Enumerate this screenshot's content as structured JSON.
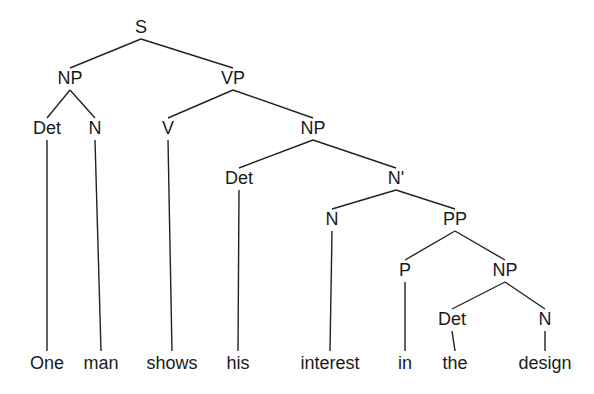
{
  "figure": {
    "kind": "syntax-tree",
    "sentence": "One man shows his interest in the design",
    "background_color": "#ffffff",
    "line_color": "#222222",
    "text_color": "#1a1a1a"
  },
  "nodes": [
    {
      "id": "s",
      "label": "S",
      "x": 141,
      "y": 33,
      "level": 0
    },
    {
      "id": "np1",
      "label": "NP",
      "x": 70,
      "y": 84,
      "level": 1
    },
    {
      "id": "vp",
      "label": "VP",
      "x": 233,
      "y": 84,
      "level": 1
    },
    {
      "id": "det1",
      "label": "Det",
      "x": 47,
      "y": 134,
      "level": 2
    },
    {
      "id": "n1",
      "label": "N",
      "x": 95,
      "y": 134,
      "level": 2
    },
    {
      "id": "v",
      "label": "V",
      "x": 168,
      "y": 134,
      "level": 2
    },
    {
      "id": "np2",
      "label": "NP",
      "x": 313,
      "y": 134,
      "level": 2
    },
    {
      "id": "det2",
      "label": "Det",
      "x": 239,
      "y": 184,
      "level": 3
    },
    {
      "id": "nbar",
      "label": "N'",
      "x": 396,
      "y": 184,
      "level": 3
    },
    {
      "id": "n2",
      "label": "N",
      "x": 332,
      "y": 225,
      "level": 4
    },
    {
      "id": "pp",
      "label": "PP",
      "x": 455,
      "y": 225,
      "level": 4
    },
    {
      "id": "p",
      "label": "P",
      "x": 405,
      "y": 276,
      "level": 5
    },
    {
      "id": "np3",
      "label": "NP",
      "x": 505,
      "y": 276,
      "level": 5
    },
    {
      "id": "det3",
      "label": "Det",
      "x": 452,
      "y": 325,
      "level": 6
    },
    {
      "id": "n3",
      "label": "N",
      "x": 545,
      "y": 325,
      "level": 6
    }
  ],
  "edges": [
    {
      "from": "s",
      "to": "np1"
    },
    {
      "from": "s",
      "to": "vp"
    },
    {
      "from": "np1",
      "to": "det1"
    },
    {
      "from": "np1",
      "to": "n1"
    },
    {
      "from": "vp",
      "to": "v"
    },
    {
      "from": "vp",
      "to": "np2"
    },
    {
      "from": "np2",
      "to": "det2"
    },
    {
      "from": "np2",
      "to": "nbar"
    },
    {
      "from": "nbar",
      "to": "n2"
    },
    {
      "from": "nbar",
      "to": "pp"
    },
    {
      "from": "pp",
      "to": "p"
    },
    {
      "from": "pp",
      "to": "np3"
    },
    {
      "from": "np3",
      "to": "det3"
    },
    {
      "from": "np3",
      "to": "n3"
    }
  ],
  "leaves": [
    {
      "id": "w-one",
      "label": "One",
      "parent": "det1",
      "x": 47,
      "y": 369,
      "stem_top": 140,
      "stem_bottom": 351
    },
    {
      "id": "w-man",
      "label": "man",
      "parent": "n1",
      "x": 101,
      "y": 369,
      "stem_top": 140,
      "stem_bottom": 351
    },
    {
      "id": "w-shows",
      "label": "shows",
      "parent": "v",
      "x": 172,
      "y": 369,
      "stem_top": 140,
      "stem_bottom": 351
    },
    {
      "id": "w-his",
      "label": "his",
      "parent": "det2",
      "x": 238,
      "y": 369,
      "stem_top": 190,
      "stem_bottom": 351
    },
    {
      "id": "w-interest",
      "label": "interest",
      "parent": "n2",
      "x": 330,
      "y": 369,
      "stem_top": 231,
      "stem_bottom": 351
    },
    {
      "id": "w-in",
      "label": "in",
      "parent": "p",
      "x": 405,
      "y": 369,
      "stem_top": 282,
      "stem_bottom": 351
    },
    {
      "id": "w-the",
      "label": "the",
      "parent": "det3",
      "x": 455,
      "y": 369,
      "stem_top": 331,
      "stem_bottom": 351
    },
    {
      "id": "w-design",
      "label": "design",
      "parent": "n3",
      "x": 545,
      "y": 369,
      "stem_top": 331,
      "stem_bottom": 351
    }
  ],
  "geometry": {
    "node_bottom_offset": 6,
    "child_top_offset": 16
  },
  "chart_data": {
    "type": "tree",
    "terminals": [
      "One",
      "man",
      "shows",
      "his",
      "interest",
      "in",
      "the",
      "design"
    ],
    "nonterminals": [
      "S",
      "NP",
      "VP",
      "Det",
      "N",
      "V",
      "NP",
      "Det",
      "N'",
      "N",
      "PP",
      "P",
      "NP",
      "Det",
      "N"
    ],
    "bracketing": "[S [NP [Det One] [N man]] [VP [V shows] [NP [Det his] [N' [N interest] [PP [P in] [NP [Det the] [N design]]]]]]]",
    "rules": [
      "S -> NP VP",
      "NP -> Det N",
      "VP -> V NP",
      "NP -> Det N'",
      "N' -> N PP",
      "PP -> P NP",
      "NP -> Det N"
    ]
  }
}
